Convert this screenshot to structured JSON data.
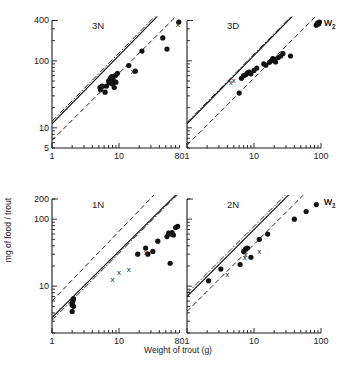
{
  "chart_data": {
    "type": "scatter",
    "ylabel": "mg of food / trout",
    "xlabel": "Weight of trout (g)",
    "xscale": "log",
    "yscale": "log",
    "panels": [
      {
        "id": "3N",
        "title": "3N",
        "xlim": [
          1,
          80
        ],
        "ylim": [
          5,
          400
        ],
        "xticks": [
          {
            "v": 1,
            "label": "1"
          },
          {
            "v": 10,
            "label": "10"
          },
          {
            "v": 80,
            "label": "80"
          }
        ],
        "yticks": [
          {
            "v": 5,
            "label": "5"
          },
          {
            "v": 10,
            "label": "10"
          },
          {
            "v": 100,
            "label": "100"
          },
          {
            "v": 400,
            "label": "400"
          }
        ],
        "lines": [
          {
            "name": "fit",
            "style": "solid",
            "a": 11.5,
            "b": 1.02
          },
          {
            "name": "W2",
            "style": "dashdot",
            "a": 12.5,
            "b": 1.02
          },
          {
            "name": "W1",
            "style": "dash",
            "a": 6.5,
            "b": 1.0
          }
        ],
        "points": [
          [
            5.2,
            40
          ],
          [
            5.3,
            37
          ],
          [
            5.6,
            42
          ],
          [
            6.2,
            34
          ],
          [
            6.5,
            42
          ],
          [
            7.0,
            50
          ],
          [
            7.2,
            47
          ],
          [
            7.4,
            55
          ],
          [
            7.8,
            58
          ],
          [
            8.0,
            45
          ],
          [
            8.2,
            52
          ],
          [
            8.5,
            40
          ],
          [
            8.8,
            60
          ],
          [
            9.0,
            48
          ],
          [
            9.5,
            65
          ],
          [
            14,
            85
          ],
          [
            17.5,
            70
          ],
          [
            22,
            140
          ],
          [
            45,
            220
          ],
          [
            52,
            150
          ],
          [
            78,
            380
          ]
        ],
        "crosses": [
          [
            16,
            70
          ],
          [
            76,
            360
          ]
        ]
      },
      {
        "id": "3D",
        "title": "3D",
        "xlim": [
          1,
          100
        ],
        "ylim": [
          5,
          400
        ],
        "xticks": [
          {
            "v": 1,
            "label": "1"
          },
          {
            "v": 10,
            "label": "10"
          },
          {
            "v": 100,
            "label": "100"
          }
        ],
        "yticks": [],
        "lines": [
          {
            "name": "fit",
            "style": "solid",
            "a": 11.5,
            "b": 1.02
          },
          {
            "name": "W2",
            "style": "dashdot",
            "a": 12.0,
            "b": 1.02
          },
          {
            "name": "W1",
            "style": "dash",
            "a": 5.5,
            "b": 1.0
          }
        ],
        "line_labels": [
          {
            "text": "W2",
            "sub": "2"
          },
          {
            "text": "W1",
            "sub": "1"
          }
        ],
        "points": [
          [
            6,
            33
          ],
          [
            6.5,
            55
          ],
          [
            7,
            60
          ],
          [
            7.5,
            62
          ],
          [
            8,
            66
          ],
          [
            8.5,
            68
          ],
          [
            9,
            64
          ],
          [
            10,
            72
          ],
          [
            11,
            78
          ],
          [
            14,
            90
          ],
          [
            15,
            86
          ],
          [
            17,
            95
          ],
          [
            18,
            100
          ],
          [
            19,
            108
          ],
          [
            20,
            105
          ],
          [
            21,
            96
          ],
          [
            23,
            112
          ],
          [
            25,
            118
          ],
          [
            27,
            128
          ],
          [
            35,
            118
          ],
          [
            85,
            340
          ],
          [
            88,
            360
          ],
          [
            90,
            370
          ],
          [
            92,
            355
          ],
          [
            95,
            380
          ]
        ],
        "crosses": [
          [
            4.5,
            48
          ],
          [
            5,
            52
          ]
        ]
      },
      {
        "id": "1N",
        "title": "1N",
        "xlim": [
          1,
          80
        ],
        "ylim": [
          2,
          200
        ],
        "xticks": [
          {
            "v": 1,
            "label": "1"
          },
          {
            "v": 10,
            "label": "10"
          },
          {
            "v": 80,
            "label": "80"
          }
        ],
        "yticks": [
          {
            "v": 10,
            "label": "10"
          },
          {
            "v": 100,
            "label": "100"
          },
          {
            "v": 200,
            "label": "200"
          }
        ],
        "lines": [
          {
            "name": "fit",
            "style": "solid",
            "a": 3.4,
            "b": 0.99
          },
          {
            "name": "W2",
            "style": "dashdot",
            "a": 3.1,
            "b": 1.0
          },
          {
            "name": "W1",
            "style": "dash",
            "a": 6.0,
            "b": 1.04
          }
        ],
        "points": [
          [
            2,
            4.2
          ],
          [
            2,
            5.2
          ],
          [
            2,
            5.6
          ],
          [
            2.05,
            6.0
          ],
          [
            2.1,
            6.5
          ],
          [
            2.1,
            5.0
          ],
          [
            19,
            30
          ],
          [
            25,
            37
          ],
          [
            27,
            30
          ],
          [
            32,
            33
          ],
          [
            38,
            47
          ],
          [
            52,
            55
          ],
          [
            55,
            62
          ],
          [
            58,
            22
          ],
          [
            60,
            60
          ],
          [
            62,
            63
          ],
          [
            65,
            58
          ],
          [
            70,
            75
          ],
          [
            75,
            78
          ]
        ],
        "crosses": [
          [
            8,
            13
          ],
          [
            10,
            16
          ],
          [
            14,
            18
          ],
          [
            25,
            32
          ]
        ]
      },
      {
        "id": "2N",
        "title": "2N",
        "xlim": [
          1,
          100
        ],
        "ylim": [
          2,
          200
        ],
        "xticks": [
          {
            "v": 1,
            "label": "1"
          },
          {
            "v": 10,
            "label": "10"
          },
          {
            "v": 100,
            "label": "100"
          }
        ],
        "yticks": [],
        "lines": [
          {
            "name": "fit",
            "style": "solid",
            "a": 7.0,
            "b": 1.0
          },
          {
            "name": "W2",
            "style": "dashdot",
            "a": 7.8,
            "b": 1.0
          },
          {
            "name": "W1",
            "style": "dash",
            "a": 4.2,
            "b": 1.0
          }
        ],
        "line_labels": [
          {
            "text": "W2",
            "sub": "2"
          },
          {
            "text": "W1",
            "sub": "1"
          }
        ],
        "points": [
          [
            2.1,
            12
          ],
          [
            3.2,
            18
          ],
          [
            6.2,
            21
          ],
          [
            7,
            33
          ],
          [
            7.5,
            36
          ],
          [
            8,
            37
          ],
          [
            9,
            27
          ],
          [
            12,
            50
          ],
          [
            16,
            60
          ],
          [
            40,
            100
          ],
          [
            60,
            130
          ],
          [
            85,
            165
          ]
        ],
        "crosses": [
          [
            4,
            15
          ],
          [
            7.3,
            27
          ],
          [
            7.5,
            30
          ],
          [
            12,
            34
          ]
        ]
      }
    ]
  }
}
